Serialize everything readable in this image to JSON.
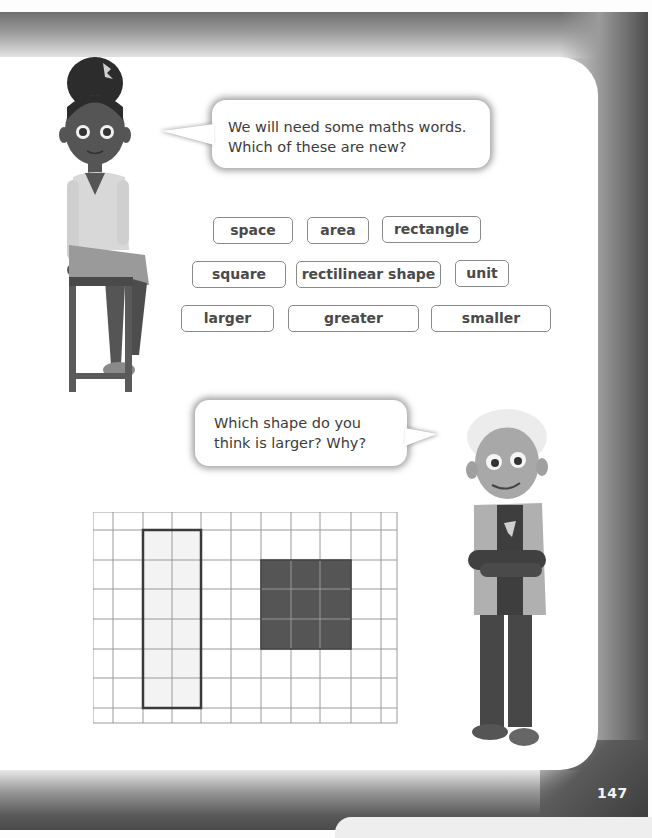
{
  "page": {
    "number": "147",
    "accent_colors": {
      "frame_dark": "#4a4a4a",
      "panel": "#ffffff",
      "box_border": "#8a8a8a",
      "shape_dark": "#555555",
      "shape_light": "#f3f3f3"
    }
  },
  "speech": {
    "girl": {
      "line1": "We will need some maths words.",
      "line2": "Which of these are new?"
    },
    "boy": {
      "line1": "Which shape do you",
      "line2": "think is larger? Why?"
    }
  },
  "vocabulary": {
    "row1": [
      "space",
      "area",
      "rectangle"
    ],
    "row2": [
      "square",
      "rectilinear shape",
      "unit"
    ],
    "row3": [
      "larger",
      "greater",
      "smaller"
    ]
  },
  "grid_figure": {
    "columns": 11,
    "rows": 8,
    "rectangle": {
      "label": "outlined rectangle",
      "width_units": 2,
      "height_units": 6
    },
    "square": {
      "label": "shaded square",
      "width_units": 3,
      "height_units": 3
    }
  },
  "characters": [
    {
      "name": "girl",
      "pose": "sitting on stool"
    },
    {
      "name": "boy",
      "pose": "standing with arms crossed"
    }
  ]
}
